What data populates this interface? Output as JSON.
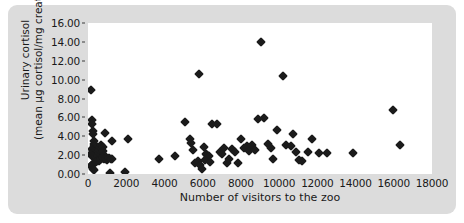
{
  "chart_data": {
    "type": "scatter",
    "title": "",
    "xlabel": "Number of visitors to the zoo",
    "ylabel_line1": "Urinary cortisol",
    "ylabel_line2": "(mean µg cortisol/mg creatinine)",
    "xlim": [
      0,
      18000
    ],
    "ylim": [
      0.0,
      16.0
    ],
    "xticks": [
      0,
      2000,
      4000,
      6000,
      8000,
      10000,
      12000,
      14000,
      16000,
      18000
    ],
    "xtick_labels": [
      "0",
      "2000",
      "4000",
      "6000",
      "8000",
      "10000",
      "12000",
      "14000",
      "16000",
      "18000"
    ],
    "yticks": [
      0.0,
      2.0,
      4.0,
      6.0,
      8.0,
      10.0,
      12.0,
      14.0,
      16.0
    ],
    "ytick_labels": [
      "0.00",
      "2.00",
      "4.00",
      "6.00",
      "8.00",
      "10.00",
      "12.00",
      "14.00",
      "16.00"
    ],
    "grid": false,
    "legend": null,
    "marker": "diamond",
    "marker_color": "#1b1b1b",
    "background_color": "#dcdcdc",
    "plot_background_color": "#ffffff",
    "points": [
      [
        150,
        8.95
      ],
      [
        200,
        5.75
      ],
      [
        220,
        5.25
      ],
      [
        250,
        4.55
      ],
      [
        260,
        4.2
      ],
      [
        300,
        3.45
      ],
      [
        320,
        3.2
      ],
      [
        340,
        2.95
      ],
      [
        200,
        2.7
      ],
      [
        240,
        2.5
      ],
      [
        280,
        2.45
      ],
      [
        330,
        2.35
      ],
      [
        380,
        2.3
      ],
      [
        420,
        2.25
      ],
      [
        150,
        2.1
      ],
      [
        200,
        1.95
      ],
      [
        250,
        1.9
      ],
      [
        300,
        1.85
      ],
      [
        350,
        1.8
      ],
      [
        400,
        1.75
      ],
      [
        460,
        1.7
      ],
      [
        520,
        1.95
      ],
      [
        560,
        2.2
      ],
      [
        600,
        2.55
      ],
      [
        640,
        2.9
      ],
      [
        700,
        3.1
      ],
      [
        760,
        2.85
      ],
      [
        800,
        2.45
      ],
      [
        840,
        2.05
      ],
      [
        880,
        1.75
      ],
      [
        620,
        1.55
      ],
      [
        560,
        1.4
      ],
      [
        480,
        1.35
      ],
      [
        400,
        1.25
      ],
      [
        330,
        1.15
      ],
      [
        280,
        1.05
      ],
      [
        220,
        0.95
      ],
      [
        180,
        0.8
      ],
      [
        260,
        0.55
      ],
      [
        340,
        0.4
      ],
      [
        700,
        1.6
      ],
      [
        780,
        1.7
      ],
      [
        860,
        1.6
      ],
      [
        940,
        1.55
      ],
      [
        1020,
        1.5
      ],
      [
        1100,
        1.65
      ],
      [
        1180,
        1.6
      ],
      [
        1250,
        1.55
      ],
      [
        900,
        4.3
      ],
      [
        1280,
        3.45
      ],
      [
        1150,
        0.15
      ],
      [
        1950,
        0.2
      ],
      [
        2100,
        3.7
      ],
      [
        3700,
        1.55
      ],
      [
        4550,
        1.95
      ],
      [
        5050,
        5.55
      ],
      [
        5350,
        3.7
      ],
      [
        5400,
        3.25
      ],
      [
        5500,
        2.55
      ],
      [
        5600,
        1.2
      ],
      [
        5750,
        1.35
      ],
      [
        5850,
        1.0
      ],
      [
        5950,
        0.55
      ],
      [
        6050,
        2.85
      ],
      [
        6150,
        2.1
      ],
      [
        6250,
        2.05
      ],
      [
        6350,
        1.95
      ],
      [
        6100,
        1.45
      ],
      [
        6400,
        1.3
      ],
      [
        5800,
        10.6
      ],
      [
        6500,
        5.3
      ],
      [
        6750,
        5.25
      ],
      [
        6900,
        2.3
      ],
      [
        7000,
        2.15
      ],
      [
        7100,
        2.75
      ],
      [
        7250,
        1.2
      ],
      [
        7400,
        1.55
      ],
      [
        7550,
        2.6
      ],
      [
        7700,
        2.3
      ],
      [
        7850,
        1.15
      ],
      [
        8000,
        3.7
      ],
      [
        8150,
        2.75
      ],
      [
        8300,
        2.95
      ],
      [
        8450,
        2.4
      ],
      [
        8600,
        3.05
      ],
      [
        8750,
        2.5
      ],
      [
        9050,
        13.95
      ],
      [
        9200,
        5.95
      ],
      [
        8900,
        5.8
      ],
      [
        9400,
        3.15
      ],
      [
        9550,
        2.8
      ],
      [
        9700,
        1.55
      ],
      [
        10200,
        10.4
      ],
      [
        9900,
        4.7
      ],
      [
        10350,
        3.05
      ],
      [
        10600,
        2.95
      ],
      [
        10750,
        4.2
      ],
      [
        10900,
        2.35
      ],
      [
        11050,
        1.45
      ],
      [
        11200,
        1.4
      ],
      [
        11500,
        2.35
      ],
      [
        11700,
        3.75
      ],
      [
        12100,
        2.25
      ],
      [
        12500,
        2.25
      ],
      [
        13850,
        2.2
      ],
      [
        15950,
        6.8
      ],
      [
        16350,
        3.1
      ]
    ]
  }
}
